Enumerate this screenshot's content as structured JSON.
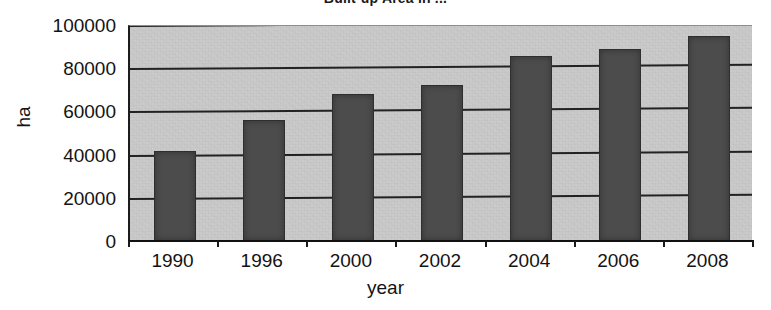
{
  "chart_data": {
    "type": "bar",
    "title": "Built-up Area in ...",
    "xlabel": "year",
    "ylabel": "ha",
    "categories": [
      "1990",
      "1996",
      "2000",
      "2002",
      "2004",
      "2006",
      "2008"
    ],
    "values": [
      41500,
      56000,
      68000,
      72000,
      85500,
      89000,
      95000
    ],
    "series": [
      {
        "name": "Built-up area",
        "values": [
          41500,
          56000,
          68000,
          72000,
          85500,
          89000,
          95000
        ]
      }
    ],
    "ylim": [
      0,
      100000
    ],
    "ytick_labels": [
      "0",
      "20000",
      "40000",
      "60000",
      "80000",
      "100000"
    ],
    "ytick_values": [
      0,
      20000,
      40000,
      60000,
      80000,
      100000
    ],
    "grid": true,
    "grid_axis": "y",
    "legend": false,
    "legend_position": "none",
    "colors": {
      "bar_fill": "#4c4c4c",
      "bar_stroke": "#2e2e2e",
      "plot_background": "#c9c9c9",
      "gridline": "#222222",
      "axis": "#111111",
      "page_background": "#ffffff",
      "text": "#131313"
    }
  }
}
